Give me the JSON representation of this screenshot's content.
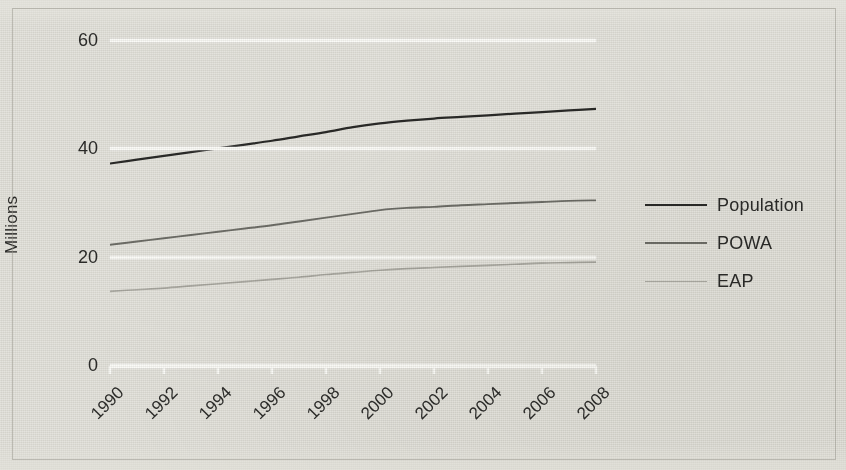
{
  "axis": {
    "y_title": "Millions",
    "y_ticks": [
      "0",
      "20",
      "40",
      "60"
    ],
    "x_ticks": [
      "1990",
      "1992",
      "1994",
      "1996",
      "1998",
      "2000",
      "2002",
      "2004",
      "2006",
      "2008"
    ]
  },
  "legend": {
    "items": [
      {
        "label": "Population",
        "color": "#2a2a28"
      },
      {
        "label": "POWA",
        "color": "#6e6e68"
      },
      {
        "label": "EAP",
        "color": "#aaa9a2"
      }
    ]
  },
  "colors": {
    "background": "#e4e3dd",
    "gridline": "#fbfbf8",
    "text": "#2c2c2a",
    "population": "#2a2a28",
    "powa": "#6e6e68",
    "eap": "#aaa9a2"
  },
  "chart_data": {
    "type": "line",
    "title": "",
    "xlabel": "",
    "ylabel": "Millions",
    "xlim": [
      1990,
      2008
    ],
    "ylim": [
      0,
      60
    ],
    "yticks": [
      0,
      20,
      40,
      60
    ],
    "xticks": [
      1990,
      1992,
      1994,
      1996,
      1998,
      2000,
      2002,
      2004,
      2006,
      2008
    ],
    "grid": "horizontal",
    "legend_position": "right",
    "x": [
      1990,
      1991,
      1992,
      1993,
      1994,
      1995,
      1996,
      1997,
      1998,
      1999,
      2000,
      2001,
      2002,
      2003,
      2004,
      2005,
      2006,
      2007,
      2008
    ],
    "series": [
      {
        "name": "Population",
        "color": "#2a2a28",
        "values": [
          37.2,
          37.9,
          38.6,
          39.3,
          40.0,
          40.7,
          41.4,
          42.2,
          43.0,
          43.9,
          44.6,
          45.1,
          45.5,
          45.8,
          46.1,
          46.4,
          46.7,
          47.0,
          47.3
        ]
      },
      {
        "name": "POWA",
        "color": "#6e6e68",
        "values": [
          22.2,
          22.8,
          23.4,
          24.0,
          24.6,
          25.2,
          25.8,
          26.5,
          27.2,
          27.9,
          28.6,
          29.0,
          29.2,
          29.5,
          29.7,
          29.9,
          30.1,
          30.3,
          30.4
        ]
      },
      {
        "name": "EAP",
        "color": "#aaa9a2",
        "values": [
          13.6,
          13.9,
          14.2,
          14.6,
          15.0,
          15.4,
          15.8,
          16.2,
          16.7,
          17.1,
          17.5,
          17.8,
          18.0,
          18.2,
          18.4,
          18.6,
          18.8,
          18.9,
          19.0
        ]
      }
    ]
  }
}
